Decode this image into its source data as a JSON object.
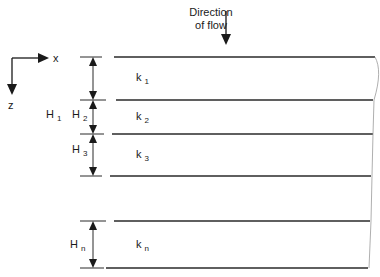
{
  "diagram": {
    "flow_label_line1": "Direction",
    "flow_label_line2": "of flow",
    "axes": {
      "x_label": "x",
      "z_label": "z"
    },
    "total_thickness": {
      "symbol": "H",
      "subscript": "1"
    },
    "layers": [
      {
        "h_symbol": "H",
        "h_sub": "2",
        "k_symbol": "k",
        "k_sub": "1"
      },
      {
        "h_symbol": "H",
        "h_sub": "2",
        "k_symbol": "k",
        "k_sub": "2"
      },
      {
        "h_symbol": "H",
        "h_sub": "3",
        "k_symbol": "k",
        "k_sub": "3"
      },
      {
        "h_symbol": "H",
        "h_sub": "n",
        "k_symbol": "k",
        "k_sub": "n"
      }
    ],
    "colors": {
      "line": "#2a2a2a",
      "background": "#ffffff",
      "edge": "#9a9a9a"
    }
  }
}
